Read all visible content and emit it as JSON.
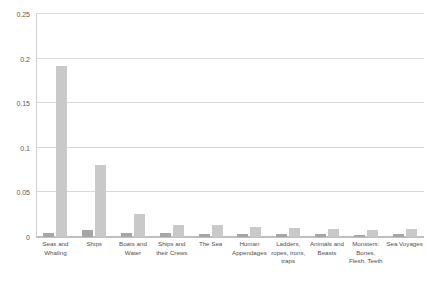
{
  "chart_data": {
    "type": "bar",
    "title": "",
    "subtitle": "",
    "xlabel": "",
    "ylabel": "",
    "ylim": [
      0,
      0.25
    ],
    "yticks": [
      0,
      0.05,
      0.1,
      0.15,
      0.2,
      0.25
    ],
    "ytick_labels": [
      "0",
      "0.05",
      "0.1",
      "0.15",
      "0.2",
      "0.25"
    ],
    "grid": true,
    "legend": "none",
    "categories": [
      "Seas and Whaling",
      "Ships",
      "Boats and Water",
      "Ships and their Crews",
      "The Sea",
      "Human Appendages",
      "Ladders, ropes, irons, traps",
      "Animals and Beasts",
      "Monsters: Bones, Flesh, Teeth",
      "Sea Voyages"
    ],
    "series": [
      {
        "name": "Series 1",
        "color": "#a6a6a6",
        "values": [
          0.004,
          0.008,
          0.004,
          0.004,
          0.003,
          0.003,
          0.003,
          0.003,
          0.002,
          0.003
        ]
      },
      {
        "name": "Series 2",
        "color": "#c9c9c9",
        "values": [
          0.192,
          0.081,
          0.026,
          0.013,
          0.013,
          0.011,
          0.01,
          0.009,
          0.008,
          0.009
        ]
      }
    ]
  },
  "colors": {
    "series_1": "#a6a6a6",
    "series_2": "#c9c9c9",
    "gridline": "#d9d9d9",
    "axis": "#bfbfbf",
    "tick_text": "#5a5a5a",
    "background": "#ffffff"
  }
}
